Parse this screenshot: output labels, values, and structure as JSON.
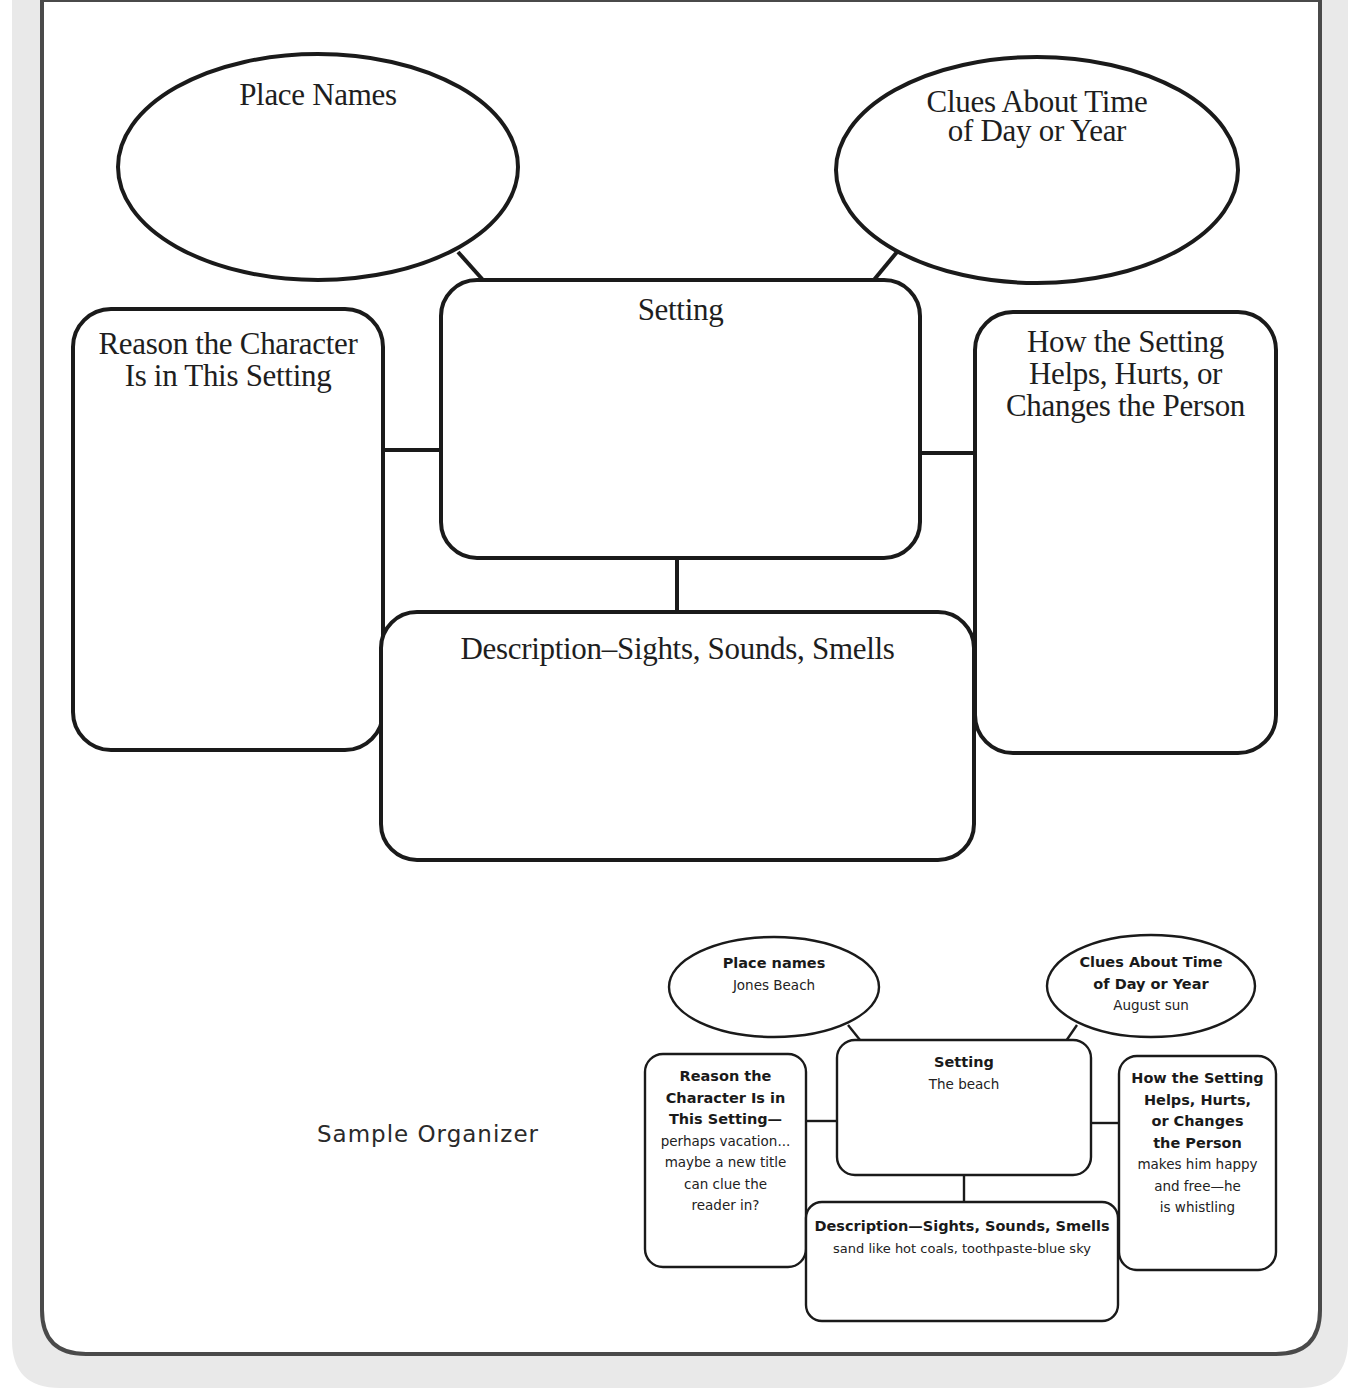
{
  "organizer": {
    "place_names": "Place Names",
    "time_clues": [
      "Clues About Time",
      "of Day or Year"
    ],
    "setting": "Setting",
    "reason": [
      "Reason the Character",
      "Is in This Setting"
    ],
    "how": [
      "How the Setting",
      "Helps, Hurts, or",
      "Changes the Person"
    ],
    "description": "Description–Sights, Sounds, Smells"
  },
  "sample": {
    "title": "Sample Organizer",
    "place_names": {
      "heading": "Place names",
      "value": "Jones Beach"
    },
    "time_clues": {
      "heading": [
        "Clues About Time",
        "of Day or Year"
      ],
      "value": "August sun"
    },
    "setting": {
      "heading": "Setting",
      "value": "The beach"
    },
    "reason": {
      "heading": [
        "Reason the",
        "Character Is in",
        "This Setting—"
      ],
      "value": [
        "perhaps vacation...",
        "maybe a new title",
        "can clue the",
        "reader in?"
      ]
    },
    "how": {
      "heading": [
        "How the Setting",
        "Helps, Hurts,",
        "or Changes",
        "the Person"
      ],
      "value": [
        "makes him happy",
        "and free—he",
        "is whistling"
      ]
    },
    "description": {
      "heading": "Description—Sights, Sounds, Smells",
      "value": "sand like hot coals, toothpaste-blue sky"
    }
  },
  "colors": {
    "frame_band": "#e9e9e9",
    "frame_line": "#4a4a4a",
    "shape_stroke": "#1a1a1a"
  }
}
